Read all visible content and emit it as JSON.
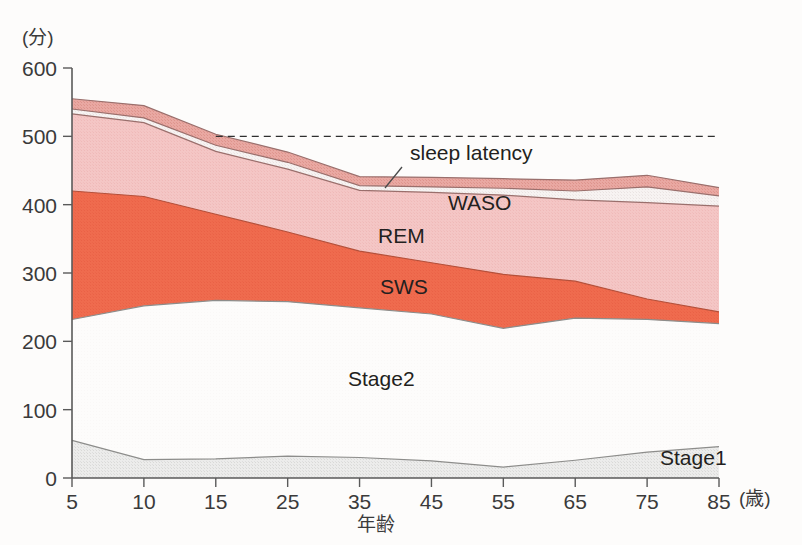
{
  "chart_data": {
    "type": "area",
    "title": "",
    "xlabel": "年齢",
    "ylabel": "(分)",
    "xunit": "(歳)",
    "categories": [
      5,
      10,
      15,
      25,
      35,
      45,
      55,
      65,
      75,
      85
    ],
    "tick_labels_x": [
      "5",
      "10",
      "15",
      "25",
      "35",
      "45",
      "55",
      "65",
      "75",
      "85"
    ],
    "tick_labels_y": [
      "0",
      "100",
      "200",
      "300",
      "400",
      "500",
      "600"
    ],
    "ylim": [
      0,
      600
    ],
    "yticks": [
      0,
      100,
      200,
      300,
      400,
      500,
      600
    ],
    "grid": false,
    "legend_position": "inline",
    "stacked": true,
    "reference_line": {
      "value": 500,
      "style": "dashed",
      "from_x": 15,
      "to_x": 85
    },
    "series": [
      {
        "name": "Stage1",
        "color": "#e8e8e6",
        "label_color": "#231f20",
        "cumulative_top": [
          55,
          27,
          28,
          32,
          30,
          25,
          16,
          26,
          38,
          46
        ]
      },
      {
        "name": "Stage2",
        "color": "#fdfcfb",
        "label_color": "#231f20",
        "cumulative_top": [
          232,
          252,
          260,
          258,
          249,
          240,
          219,
          234,
          232,
          226
        ]
      },
      {
        "name": "SWS",
        "color": "#ef6b4e",
        "label_color": "#fdf3ef",
        "cumulative_top": [
          420,
          412,
          386,
          360,
          332,
          315,
          298,
          288,
          262,
          243
        ]
      },
      {
        "name": "REM",
        "color": "#f3c3c2",
        "label_color": "#231f20",
        "cumulative_top": [
          533,
          520,
          478,
          452,
          421,
          418,
          414,
          407,
          403,
          398
        ]
      },
      {
        "name": "WASO",
        "color": "#f6f2f1",
        "label_color": "#231f20",
        "cumulative_top": [
          540,
          527,
          487,
          462,
          428,
          426,
          424,
          420,
          426,
          413
        ]
      },
      {
        "name": "sleep latency",
        "color": "#e8a6a0",
        "label_color": "#231f20",
        "cumulative_top": [
          555,
          545,
          503,
          477,
          441,
          440,
          438,
          436,
          443,
          425
        ]
      }
    ],
    "inline_labels": [
      {
        "text": "sleep latency",
        "x_px": 410,
        "y_px": 160,
        "anchor": "start",
        "color": "#231f20"
      },
      {
        "text": "WASO",
        "x_px": 448,
        "y_px": 210,
        "anchor": "start",
        "color": "#231f20"
      },
      {
        "text": "REM",
        "x_px": 378,
        "y_px": 243,
        "anchor": "start",
        "color": "#231f20"
      },
      {
        "text": "SWS",
        "x_px": 380,
        "y_px": 294,
        "anchor": "start",
        "color": "#fdf3ef"
      },
      {
        "text": "Stage2",
        "x_px": 348,
        "y_px": 386,
        "anchor": "start",
        "color": "#231f20"
      },
      {
        "text": "Stage1",
        "x_px": 660,
        "y_px": 465,
        "anchor": "start",
        "color": "#231f20"
      }
    ]
  },
  "axis": {
    "y_unit": "(分)",
    "x_unit": "(歳)",
    "x_title": "年齢"
  }
}
